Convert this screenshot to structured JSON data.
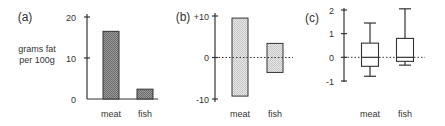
{
  "figure": {
    "panels": [
      {
        "label": "(a)"
      },
      {
        "label": "(b)"
      },
      {
        "label": "(c)"
      }
    ]
  },
  "colors": {
    "axis": "#333333",
    "bar_dark": "#8a8a8a",
    "bar_light": "#dcdcdc",
    "text": "#333333"
  },
  "chart_data": [
    {
      "type": "bar",
      "panel": "(a)",
      "title": "",
      "xlabel": "",
      "ylabel": "grams fat per 100g",
      "ylabel_lines": [
        "grams fat",
        "per 100g"
      ],
      "categories": [
        "meat",
        "fish"
      ],
      "values": [
        16.5,
        2.4
      ],
      "yticks": [
        0,
        10,
        20
      ],
      "ytick_labels": [
        "0",
        "10",
        "20"
      ],
      "ylim": [
        0,
        20
      ],
      "grid": false,
      "fill": "dark hatched"
    },
    {
      "type": "bar",
      "panel": "(b)",
      "title": "",
      "xlabel": "",
      "ylabel": "",
      "categories": [
        "meat",
        "fish"
      ],
      "series": [
        {
          "name": "upper",
          "values": [
            9.5,
            3.4
          ]
        },
        {
          "name": "lower",
          "values": [
            -9.3,
            -3.6
          ]
        }
      ],
      "yticks": [
        -10,
        0,
        10
      ],
      "ytick_labels": [
        "-10",
        "0",
        "+10"
      ],
      "ylim": [
        -10,
        10
      ],
      "reference_line": {
        "y": 0,
        "style": "dotted"
      },
      "grid": false,
      "fill": "light hatched"
    },
    {
      "type": "box",
      "panel": "(c)",
      "title": "",
      "xlabel": "",
      "ylabel": "",
      "categories": [
        "meat",
        "fish"
      ],
      "boxes": [
        {
          "name": "meat",
          "whisker_low": -0.8,
          "q1": -0.38,
          "median": 0.0,
          "q3": 0.6,
          "whisker_high": 1.45
        },
        {
          "name": "fish",
          "whisker_low": -0.33,
          "q1": -0.17,
          "median": 0.0,
          "q3": 0.8,
          "whisker_high": 2.05
        }
      ],
      "yticks": [
        -1,
        0,
        1,
        2
      ],
      "ytick_labels": [
        "-1",
        "0",
        "1",
        "2"
      ],
      "ylim": [
        -1,
        2
      ],
      "reference_line": {
        "y": 0,
        "style": "dotted"
      },
      "grid": false
    }
  ]
}
